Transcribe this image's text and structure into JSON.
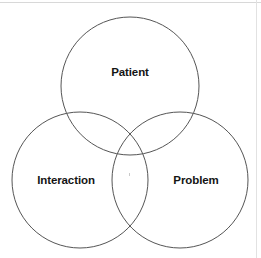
{
  "diagram": {
    "type": "venn",
    "title": "",
    "background_color": "#ffffff",
    "stroke_color": "#555555",
    "stroke_width": 1,
    "label_color": "#151515",
    "border_color": "#d8d8d8",
    "width": 261,
    "height": 258,
    "sets": [
      {
        "id": "patient",
        "label": "Patient",
        "cx": 130,
        "cy": 86,
        "r": 69,
        "label_x": 130,
        "label_y": 73,
        "position": "top"
      },
      {
        "id": "interaction",
        "label": "Interaction",
        "cx": 80,
        "cy": 180,
        "r": 68,
        "label_x": 66,
        "label_y": 181,
        "position": "bottom-left"
      },
      {
        "id": "problem",
        "label": "Problem",
        "cx": 180,
        "cy": 180,
        "r": 68,
        "label_x": 196,
        "label_y": 181,
        "position": "bottom-right"
      }
    ],
    "intersections": [
      {
        "id": "patient-interaction",
        "label": ""
      },
      {
        "id": "patient-problem",
        "label": ""
      },
      {
        "id": "interaction-problem",
        "label": ""
      },
      {
        "id": "patient-interaction-problem",
        "label": ""
      }
    ]
  }
}
